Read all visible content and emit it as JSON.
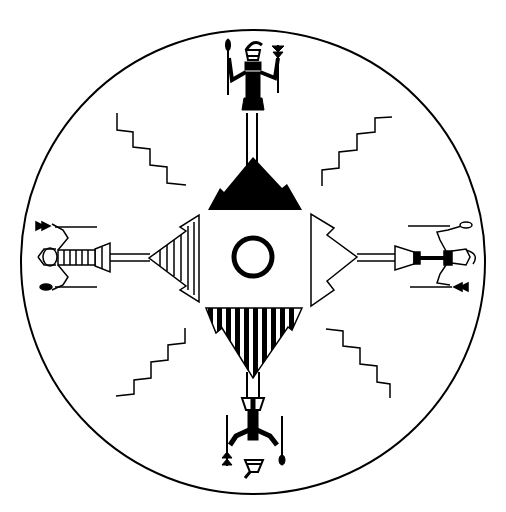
{
  "artwork": {
    "kind": "sandpainting-style line illustration",
    "colors": {
      "ink": "#000000",
      "paper": "#ffffff"
    },
    "elements": [
      "outer-circle",
      "center-square-with-ring",
      "north-black-mountain",
      "south-striped-mountain",
      "west-striped-triangle",
      "east-outlined-triangle",
      "four-holy-people-figures",
      "four-zigzag-lightning-lines"
    ]
  }
}
